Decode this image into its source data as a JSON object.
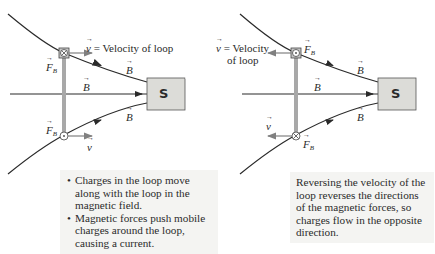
{
  "left_panel": {
    "velocity_label": "= Velocity of loop",
    "velocity_symbol": "v",
    "force_symbol": "F",
    "force_subscript": "B",
    "field_symbol": "B",
    "magnet_label": "S",
    "top_marker": "into-page (⊗)",
    "bottom_marker": "out-of-page (⊙)",
    "caption_items": [
      "Charges in the loop move along with the loop in the magnetic field.",
      "Magnetic forces push mobile charges around the loop, causing a current."
    ]
  },
  "right_panel": {
    "velocity_label_line1": "= Velocity",
    "velocity_label_line2": "of loop",
    "velocity_symbol": "v",
    "force_symbol": "F",
    "force_subscript": "B",
    "field_symbol": "B",
    "magnet_label": "S",
    "top_marker": "out-of-page (⊙)",
    "bottom_marker": "into-page (⊗)",
    "caption_text": "Reversing the velocity of the loop reverses the directions of the magnetic forces, so charges flow in the opposite direction."
  },
  "colors": {
    "field_line": "#2a2a2a",
    "loop": "#9a9a9a",
    "velocity_arrow": "#808080",
    "magnet_fill": "#dcdcd8",
    "caption_bg": "#f4f4f2"
  }
}
